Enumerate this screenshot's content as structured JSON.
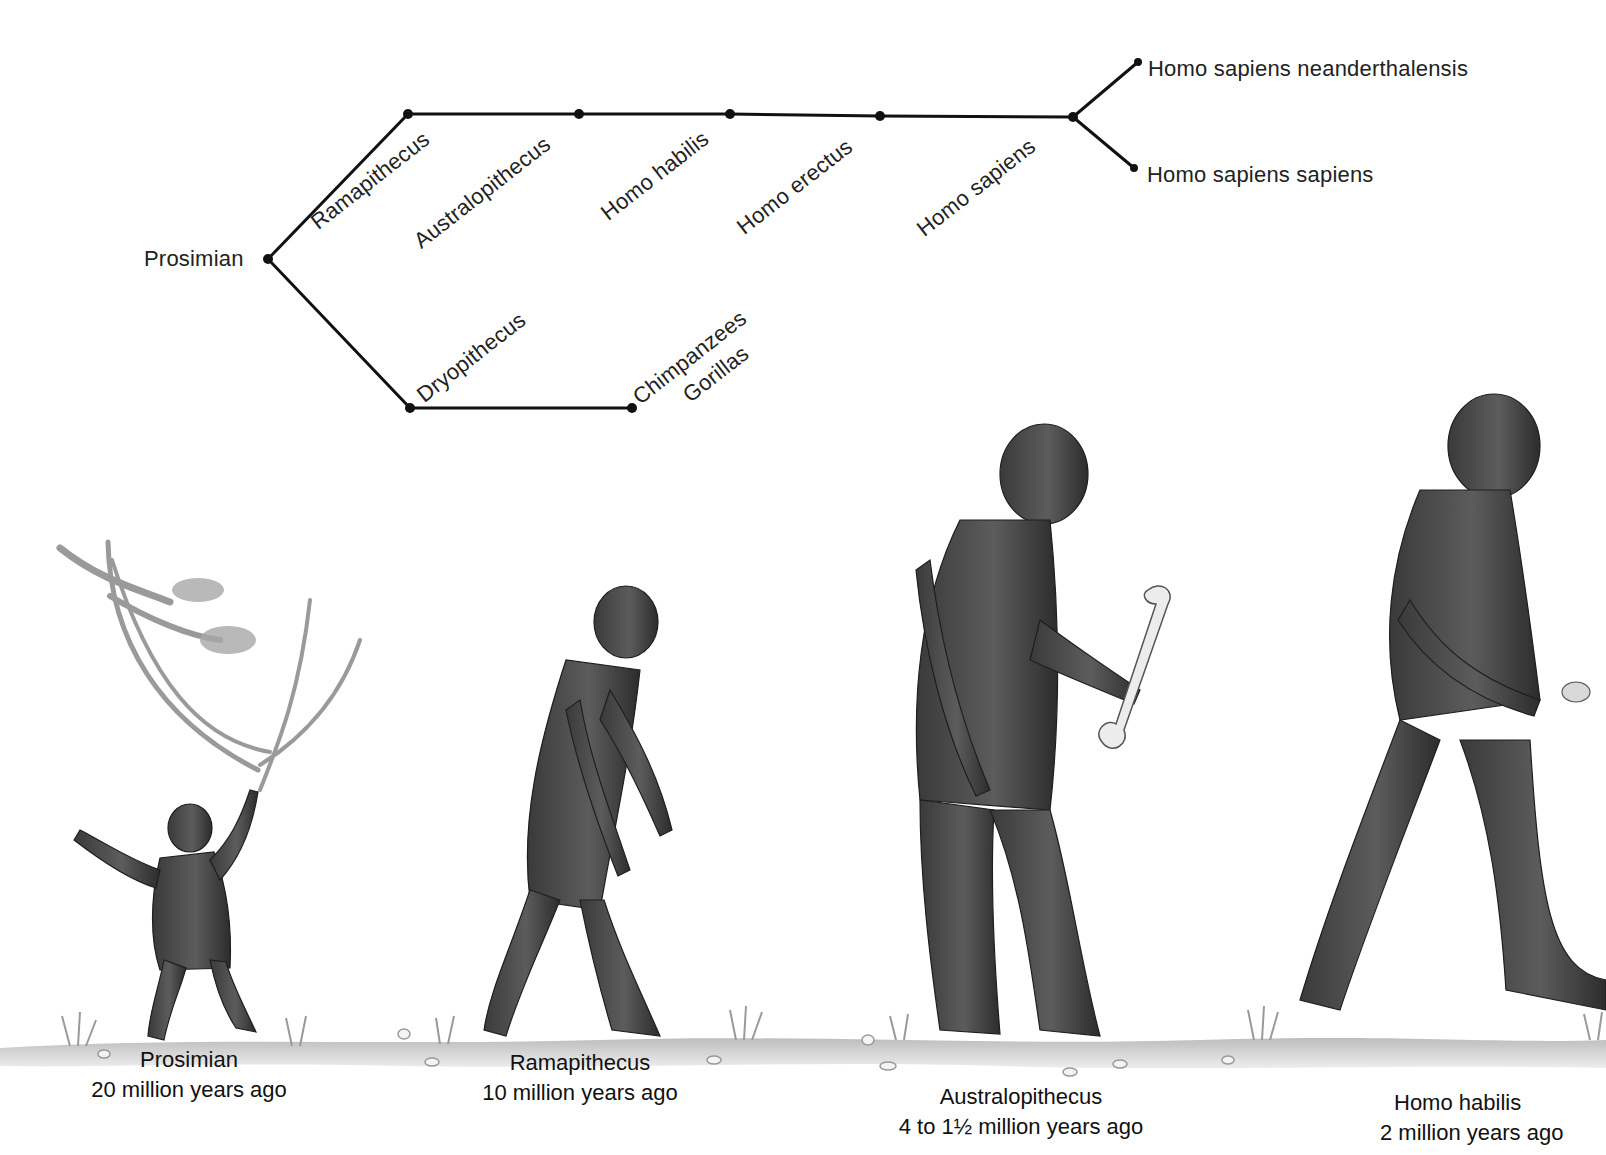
{
  "diagram": {
    "type": "phylogenetic-tree",
    "root": "Prosimian",
    "upper_branch": [
      "Ramapithecus",
      "Australopithecus",
      "Homo habilis",
      "Homo erectus",
      "Homo sapiens"
    ],
    "sapiens_split": [
      "Homo sapiens neanderthalensis",
      "Homo sapiens sapiens"
    ],
    "lower_branch": [
      "Dryopithecus",
      "Chimpanzees",
      "Gorillas"
    ],
    "labels": {
      "prosimian": "Prosimian",
      "ramapithecus": "Ramapithecus",
      "australopithecus": "Australopithecus",
      "homo_habilis": "Homo habilis",
      "homo_erectus": "Homo erectus",
      "homo_sapiens": "Homo sapiens",
      "neanderthalensis": "Homo sapiens neanderthalensis",
      "sapiens_sapiens": "Homo sapiens sapiens",
      "dryopithecus": "Dryopithecus",
      "chimpanzees": "Chimpanzees",
      "gorillas": "Gorillas"
    }
  },
  "figures": [
    {
      "name": "Prosimian",
      "age": "20 million years ago"
    },
    {
      "name": "Ramapithecus",
      "age": "10 million years ago"
    },
    {
      "name": "Australopithecus",
      "age": "4 to 1½ million years ago"
    },
    {
      "name": "Homo habilis",
      "age": "2 million years ago"
    }
  ],
  "colors": {
    "line": "#111111",
    "fur_dark": "#2e2e2e",
    "fur_mid": "#5a5a5a",
    "fur_light": "#8a8a8a",
    "ground": "#c9c9c9",
    "branch": "#9a9a9a",
    "bone": "#ececec"
  }
}
